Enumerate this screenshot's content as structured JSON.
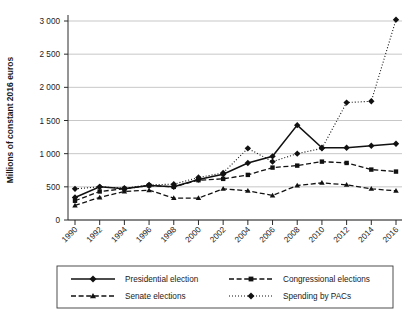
{
  "chart_data": {
    "type": "line",
    "title": "",
    "xlabel": "",
    "ylabel": "Millions of constant 2016 euros",
    "x": [
      1990,
      1992,
      1994,
      1996,
      1998,
      2000,
      2002,
      2004,
      2006,
      2008,
      2010,
      2012,
      2014,
      2016
    ],
    "categories": [
      "1990",
      "1992",
      "1994",
      "1996",
      "1998",
      "2000",
      "2002",
      "2004",
      "2006",
      "2008",
      "2010",
      "2012",
      "2014",
      "2016"
    ],
    "xtick_labels": [
      "1990",
      "1992",
      "1994",
      "1996",
      "1998",
      "2000",
      "2002",
      "2004",
      "2006",
      "2008",
      "2010",
      "2012",
      "2014",
      "2016"
    ],
    "ytick_labels": [
      "0",
      "500",
      "1 000",
      "1 500",
      "2 000",
      "2 500",
      "3 000"
    ],
    "ytick_values": [
      0,
      500,
      1000,
      1500,
      2000,
      2500,
      3000
    ],
    "ylim": [
      0,
      3150
    ],
    "xlim": [
      1989,
      2017
    ],
    "grid": "horizontal",
    "legend_position": "bottom",
    "legend_columns": 2,
    "series": [
      {
        "name": "Presidential election",
        "marker": "diamond",
        "linestyle": "solid",
        "color": "#111111",
        "values": [
          340,
          500,
          470,
          520,
          500,
          610,
          690,
          860,
          960,
          1430,
          1090,
          1090,
          1120,
          1150
        ]
      },
      {
        "name": "Congressional elections",
        "marker": "square",
        "linestyle": "dashed",
        "color": "#111111",
        "values": [
          290,
          430,
          470,
          520,
          500,
          600,
          620,
          680,
          790,
          820,
          880,
          860,
          760,
          730
        ]
      },
      {
        "name": "Senate elections",
        "marker": "triangle",
        "linestyle": "dashed",
        "color": "#111111",
        "values": [
          220,
          340,
          430,
          450,
          330,
          330,
          470,
          440,
          370,
          520,
          560,
          530,
          470,
          440
        ]
      },
      {
        "name": "Spending by PACs",
        "marker": "diamond",
        "linestyle": "dotted",
        "color": "#111111",
        "values": [
          470,
          500,
          480,
          530,
          540,
          640,
          710,
          1080,
          880,
          1000,
          1080,
          1770,
          1790,
          3020
        ]
      }
    ]
  },
  "legend": {
    "items": [
      {
        "label": "Presidential election",
        "style": "solid",
        "marker": "diamond"
      },
      {
        "label": "Congressional elections",
        "style": "dashed",
        "marker": "square"
      },
      {
        "label": "Senate elections",
        "style": "dashed",
        "marker": "triangle"
      },
      {
        "label": "Spending by PACs",
        "style": "dotted",
        "marker": "diamond"
      }
    ]
  }
}
